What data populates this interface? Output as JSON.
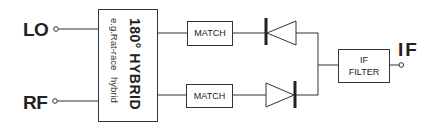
{
  "diagram": {
    "ports": {
      "lo": "LO",
      "rf": "RF",
      "if": "IF"
    },
    "hybrid": {
      "title": "180° HYBRID",
      "subtitle": "e.g.Rat-race  hybrid"
    },
    "blocks": {
      "match_top": "MATCH",
      "match_bottom": "MATCH",
      "if_filter_line1": "IF",
      "if_filter_line2": "FILTER"
    },
    "components": {
      "diode_top": "diode-reverse",
      "diode_bottom": "diode-forward"
    },
    "colors": {
      "line": "#333333",
      "text": "#222222",
      "background": "#ffffff"
    }
  }
}
